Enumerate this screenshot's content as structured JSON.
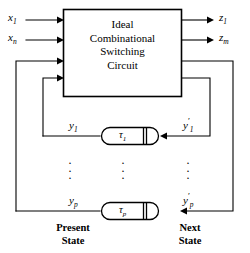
{
  "figure": {
    "block": {
      "title_lines": [
        "Ideal",
        "Combinational",
        "Switching",
        "Circuit"
      ]
    },
    "inputs": [
      {
        "id": "x1",
        "base": "x",
        "sub": "1"
      },
      {
        "id": "xn",
        "base": "x",
        "sub": "n"
      }
    ],
    "outputs": [
      {
        "id": "z1",
        "base": "z",
        "sub": "1"
      },
      {
        "id": "zm",
        "base": "z",
        "sub": "m"
      }
    ],
    "present_state": [
      {
        "id": "y1",
        "base": "y",
        "sub": "1"
      },
      {
        "id": "yp",
        "base": "y",
        "sub": "p"
      }
    ],
    "next_state": [
      {
        "id": "y1p",
        "base": "y",
        "sub": "1",
        "prime": "′"
      },
      {
        "id": "ypp",
        "base": "y",
        "sub": "p",
        "prime": "′"
      }
    ],
    "delays": [
      {
        "id": "tau1",
        "base": "τ",
        "sub": "1"
      },
      {
        "id": "taup",
        "base": "τ",
        "sub": "p"
      }
    ],
    "captions": {
      "present": "Present State",
      "present_line1": "Present",
      "present_line2": "State",
      "next": "Next State",
      "next_line1": "Next",
      "next_line2": "State"
    },
    "ellipsis": {
      "glyph": "·",
      "count": 3
    },
    "colors": {
      "stroke": "#000000",
      "background": "#ffffff",
      "text": "#000000"
    }
  }
}
